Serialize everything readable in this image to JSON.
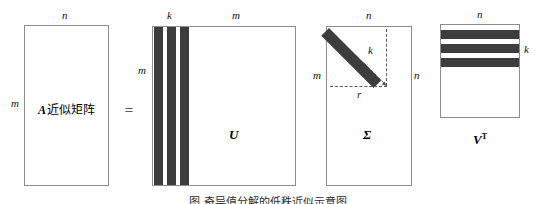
{
  "figure": {
    "type": "svd-low-rank-approximation-diagram",
    "equals_sign": "=",
    "caption": "图 奇异值分解的低秩近似示意图"
  },
  "matrix_a": {
    "name": "A",
    "inner_text_latin": "A",
    "inner_text_han": "近似矩阵",
    "top_label": "n",
    "left_label": "m"
  },
  "matrix_u": {
    "name": "U",
    "top_left_label": "k",
    "top_right_label": "m",
    "left_label": "m",
    "stripe_count": 3
  },
  "matrix_sigma": {
    "name": "Σ",
    "top_label": "n",
    "left_label": "m",
    "right_label": "n",
    "diagonal_label": "k",
    "base_label": "r"
  },
  "matrix_vt": {
    "name": "V",
    "name_superscript": "T",
    "top_label": "n",
    "right_label": "k",
    "stripe_count": 3
  },
  "colors": {
    "stripe_fill": "#3d3d3d",
    "box_border": "#8c8c8c",
    "dashed_line": "#5c5c5c",
    "background": "#ffffff",
    "text": "#000000"
  }
}
